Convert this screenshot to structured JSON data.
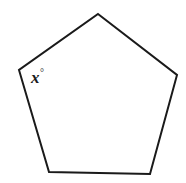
{
  "figure": {
    "type": "geometry-diagram",
    "shape_name": "pentagon",
    "background_color": "#ffffff",
    "stroke_color": "#1a1a1a",
    "fill_color": "#ffffff",
    "stroke_width": 2,
    "canvas": {
      "width": 186,
      "height": 183
    },
    "vertices": [
      {
        "name": "top",
        "x": 98,
        "y": 14
      },
      {
        "name": "right",
        "x": 177,
        "y": 75
      },
      {
        "name": "bottom-right",
        "x": 150,
        "y": 174
      },
      {
        "name": "bottom-left",
        "x": 49,
        "y": 172
      },
      {
        "name": "left",
        "x": 19,
        "y": 70
      }
    ],
    "points_path": "98,14 177,75 150,174 49,172 19,70",
    "labels": [
      {
        "name": "interior-angle-label",
        "variable": "x",
        "unit_symbol": "°",
        "at_vertex": "left",
        "x": 31,
        "y": 68
      }
    ]
  }
}
